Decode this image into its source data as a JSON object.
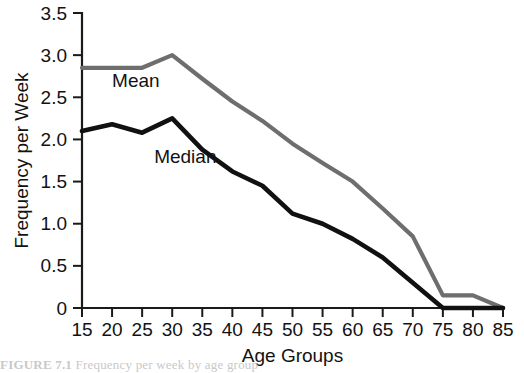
{
  "figure": {
    "caption_label": "FIGURE 7.1",
    "caption_text": "Frequency per week by age group",
    "background_color": "#ffffff"
  },
  "chart_data": {
    "type": "line",
    "title": "",
    "xlabel": "Age Groups",
    "ylabel": "Frequency per Week",
    "x": [
      15,
      20,
      25,
      30,
      35,
      40,
      45,
      50,
      55,
      60,
      65,
      70,
      75,
      80,
      85
    ],
    "xlim": [
      15,
      85
    ],
    "ylim": [
      0,
      3.5
    ],
    "y_ticks": [
      0,
      0.5,
      1.0,
      1.5,
      2.0,
      2.5,
      3.0,
      3.5
    ],
    "y_tick_labels": [
      "0",
      "0.5",
      "1.0",
      "1.5",
      "2.0",
      "2.5",
      "3.0",
      "3.5"
    ],
    "x_ticks": [
      15,
      20,
      25,
      30,
      35,
      40,
      45,
      50,
      55,
      60,
      65,
      70,
      75,
      80,
      85
    ],
    "x_tick_labels": [
      "15",
      "20",
      "25",
      "30",
      "35",
      "40",
      "45",
      "50",
      "55",
      "60",
      "65",
      "70",
      "75",
      "80",
      "85"
    ],
    "grid": false,
    "legend": "inline-annotations",
    "series": [
      {
        "name": "Mean",
        "color": "#6e6e6e",
        "stroke_width": 4.2,
        "label_x": 20,
        "label_y": 2.62,
        "values": [
          2.85,
          2.85,
          2.85,
          3.0,
          2.72,
          2.45,
          2.22,
          1.95,
          1.72,
          1.5,
          1.18,
          0.85,
          0.15,
          0.15,
          0.0
        ]
      },
      {
        "name": "Median",
        "color": "#111111",
        "stroke_width": 4.6,
        "label_x": 27,
        "label_y": 1.72,
        "values": [
          2.1,
          2.18,
          2.08,
          2.25,
          1.88,
          1.62,
          1.45,
          1.12,
          1.0,
          0.82,
          0.6,
          0.3,
          0.0,
          0.0,
          0.0
        ]
      }
    ]
  },
  "geometry": {
    "plot_left": 82,
    "plot_right": 503,
    "plot_top": 13,
    "plot_bottom": 308
  }
}
